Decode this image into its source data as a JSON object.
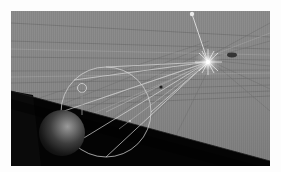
{
  "app": {
    "kind": "3d-viewport-render",
    "title": "3D Viewport Render"
  },
  "viewport": {
    "frame": {
      "x": 11,
      "y": 11,
      "width": 259,
      "height": 155,
      "border_color": "#fdfdfd"
    },
    "background_color": "#8a8a8a",
    "ground_plane_color": "#050505"
  },
  "scene": {
    "grid": {
      "name": "perspective-grid",
      "line_color": "#6e6e6e",
      "highlight_color": "#9c9c9c",
      "vertical_stripe_color": "#7d7d7d",
      "vertical_stripe_spacing": 2,
      "horizon_y": 96,
      "vanishing_x": 198,
      "visible": true
    },
    "ground": {
      "name": "ground-plane",
      "color": "#040404",
      "left_edge_y": 80,
      "right_edge_y": 150
    },
    "light": {
      "name": "spot-light-gizmo",
      "label": "Spot",
      "center_x": 197,
      "center_y": 51,
      "color": "#ffffff",
      "glow_radius": 13,
      "ray_count": 8
    },
    "light_target": {
      "name": "light-target-handle",
      "x": 181,
      "y": 2,
      "color": "#e8e8e8"
    },
    "cone": {
      "name": "spotlight-cone-wireframe",
      "color": "#d8d8d8",
      "apex_x": 197,
      "apex_y": 51,
      "base_cx": 95,
      "base_cy": 101,
      "base_rx": 45,
      "base_ry": 45,
      "line_width": 0.8
    },
    "sphere": {
      "name": "sphere-object",
      "center_x": 51,
      "center_y": 122,
      "radius": 23,
      "base_color": "#1a1a1a",
      "highlight_color": "#8d8d8d",
      "highlight_x": 58,
      "highlight_y": 116
    },
    "handle_ring": {
      "name": "gizmo-ring-handle",
      "cx": 71,
      "cy": 77,
      "r": 4.5,
      "color": "#cfcfcf"
    },
    "drop_line": {
      "name": "object-drop-line",
      "x": 71,
      "y1": 81,
      "y2": 103,
      "color": "#9a9a9a"
    },
    "dark_blob": {
      "name": "shadow-blob-marker",
      "cx": 221,
      "cy": 44,
      "rx": 5,
      "ry": 2.5,
      "color": "#2a2a2a"
    },
    "small_markers": [
      {
        "name": "cone-midpoint-marker",
        "cx": 119,
        "cy": 110,
        "r": 0.9,
        "color": "#c8c8c8"
      },
      {
        "name": "cone-axis-marker",
        "cx": 150,
        "cy": 76,
        "r": 1.4,
        "color": "#222222"
      }
    ]
  }
}
